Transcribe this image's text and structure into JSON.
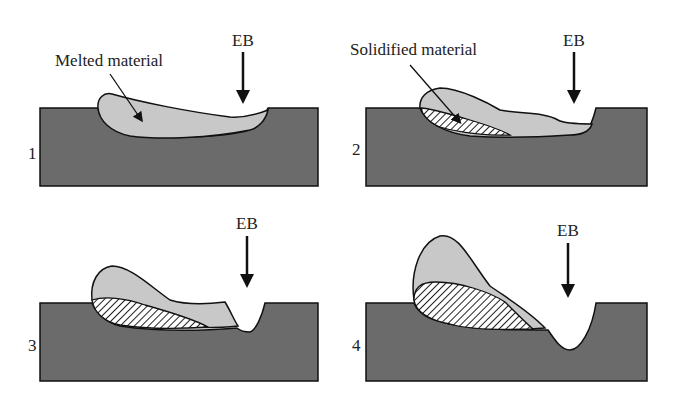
{
  "figure": {
    "colors": {
      "substrate": "#6b6b6b",
      "melted": "#c8c8c8",
      "outline": "#111111",
      "hatch": "#222222",
      "background": "#ffffff"
    },
    "beam_label": "EB",
    "annotations": {
      "melted": "Melted material",
      "solidified": "Solidified material"
    },
    "panels": [
      {
        "number": "1",
        "beam_label": "EB"
      },
      {
        "number": "2",
        "beam_label": "EB"
      },
      {
        "number": "3",
        "beam_label": "EB"
      },
      {
        "number": "4",
        "beam_label": "EB"
      }
    ]
  }
}
